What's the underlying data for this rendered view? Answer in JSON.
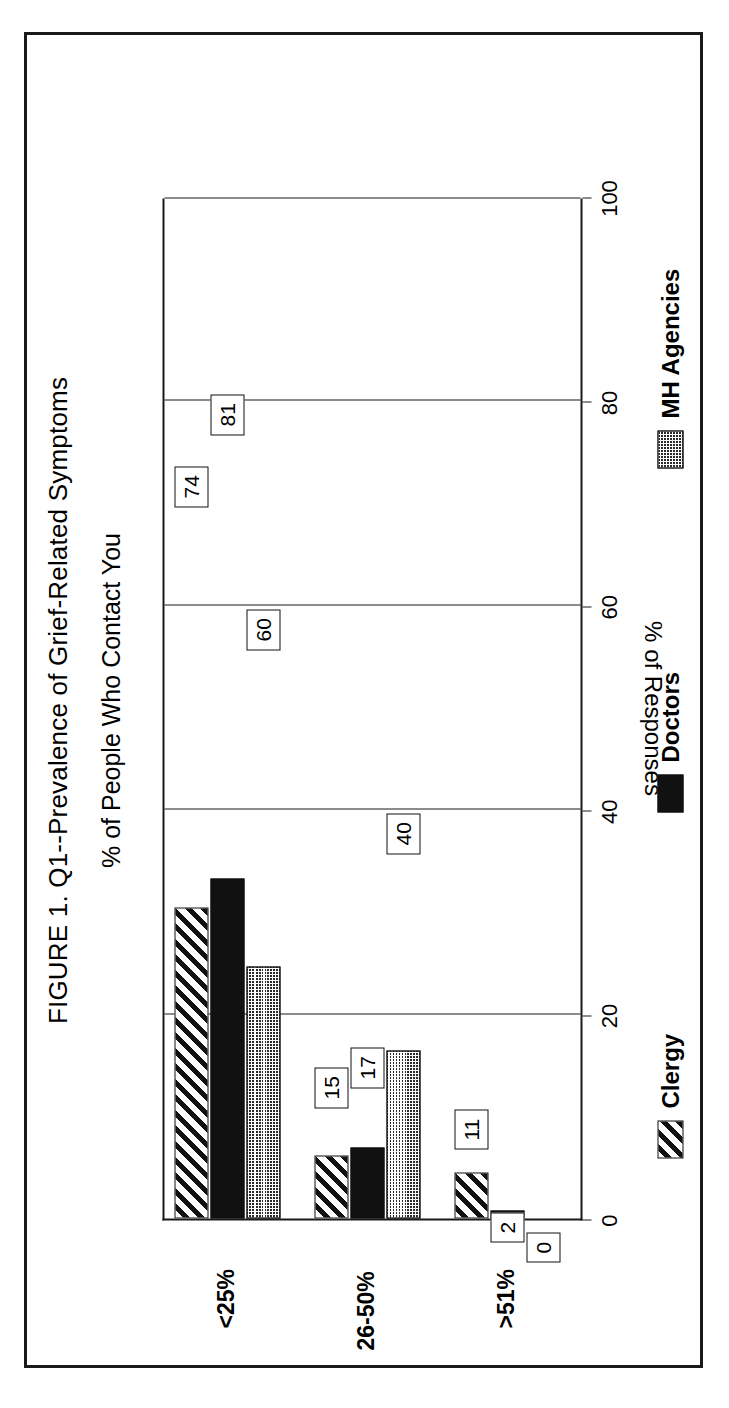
{
  "figure": {
    "title": "FIGURE 1. Q1--Prevalence of Grief-Related Symptoms",
    "subtitle": "% of People Who Contact You",
    "orientation": "rotated-90-ccw",
    "frame_color": "#1a1a1a",
    "background": "#ffffff"
  },
  "chart_data": {
    "type": "bar",
    "title": "FIGURE 1. Q1--Prevalence of Grief-Related Symptoms",
    "subtitle": "% of People Who Contact You",
    "orientation": "horizontal",
    "xlabel": "",
    "ylabel": "% of Responses",
    "ylim": [
      0,
      100
    ],
    "yticks": [
      0,
      20,
      40,
      60,
      80,
      100
    ],
    "ytick_labels": [
      "0",
      "20",
      "40",
      "60",
      "80",
      "100"
    ],
    "grid": true,
    "legend_position": "bottom",
    "categories": [
      "<25%",
      "26-50%",
      ">51%"
    ],
    "series": [
      {
        "name": "Clergy",
        "pattern": "diagonal-hatch",
        "color": "#111111",
        "values": [
          74,
          15,
          11
        ]
      },
      {
        "name": "Doctors",
        "pattern": "solid-black",
        "color": "#111111",
        "values": [
          81,
          17,
          2
        ]
      },
      {
        "name": "MH Agencies",
        "pattern": "dotted-stipple",
        "color": "#2b2b2b",
        "values": [
          60,
          40,
          0
        ]
      }
    ],
    "data_labels": [
      "74",
      "81",
      "60",
      "15",
      "17",
      "40",
      "11",
      "2",
      "0"
    ]
  },
  "axis": {
    "value_axis_title": "% of Responses",
    "ticks": [
      {
        "value": 100,
        "label": "100"
      },
      {
        "value": 80,
        "label": "80"
      },
      {
        "value": 60,
        "label": "60"
      },
      {
        "value": 40,
        "label": "40"
      },
      {
        "value": 20,
        "label": "20"
      },
      {
        "value": 0,
        "label": "0"
      }
    ]
  },
  "categories": [
    {
      "label": "<25%"
    },
    {
      "label": "26-50%"
    },
    {
      "label": ">51%"
    }
  ],
  "legend": [
    {
      "label": "Clergy"
    },
    {
      "label": "Doctors"
    },
    {
      "label": "MH Agencies"
    }
  ],
  "labels": {
    "clergy_lt25": "74",
    "doctors_lt25": "81",
    "mh_lt25": "60",
    "clergy_26to50": "15",
    "doctors_26to50": "17",
    "mh_26to50": "40",
    "clergy_gt51": "11",
    "doctors_gt51": "2",
    "mh_gt51": "0"
  }
}
